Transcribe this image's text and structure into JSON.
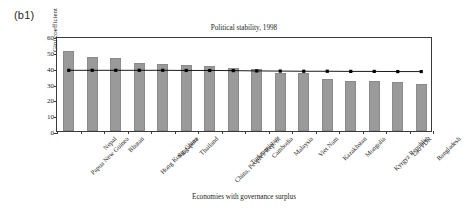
{
  "panel": {
    "label": "(b1)"
  },
  "chart_data": {
    "type": "bar",
    "title": "Political stability, 1998",
    "xlabel": "Economies with governance surplus",
    "ylabel": "Gini coefficient",
    "ylim": [
      0,
      60
    ],
    "yticks": [
      0,
      10,
      20,
      30,
      40,
      50,
      60
    ],
    "grid": false,
    "legend": "none",
    "categories": [
      "Papua New Guinea",
      "Nepal",
      "Bhutan",
      "Hong Kong, China",
      "Singapore",
      "Thailand",
      "China, People's Rep. of",
      "Turkmenistan",
      "Cambodia",
      "Malaysia",
      "Viet Nam",
      "Kazakhstan",
      "Mongolia",
      "Kyrgyz Republic",
      "Lao PDR",
      "Bangladesh"
    ],
    "series": [
      {
        "name": "Gini coefficient",
        "type": "bar",
        "color": "#9a9a9a",
        "values": [
          50.7,
          47.0,
          46.2,
          42.9,
          42.1,
          41.9,
          40.8,
          39.7,
          39.2,
          36.8,
          36.7,
          32.6,
          31.5,
          31.5,
          31.0,
          29.4
        ]
      },
      {
        "name": "Reference line",
        "type": "line",
        "color": "#000000",
        "marker": "square",
        "values": [
          39.6,
          39.6,
          39.6,
          39.6,
          39.6,
          39.5,
          39.5,
          39.4,
          39.2,
          39.1,
          39.0,
          39.0,
          38.9,
          38.9,
          38.8,
          38.8
        ]
      }
    ]
  }
}
